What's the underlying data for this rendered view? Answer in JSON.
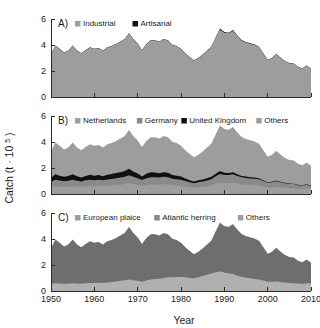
{
  "figure": {
    "xlabel": "Year",
    "ylabel_main": "Catch (t",
    "ylabel_mult": "· 10",
    "ylabel_exp": "5",
    "ylabel_close": ")",
    "ylabel_full": "Catch (t · 10⁵)"
  },
  "axes": {
    "x_ticks": [
      1950,
      1960,
      1970,
      1980,
      1990,
      2000,
      2010
    ],
    "x_tick_labels": [
      "1950",
      "1960",
      "1970",
      "1980",
      "1990",
      "2000",
      "2010"
    ],
    "y_ticks": [
      0,
      2,
      4,
      6
    ],
    "y_tick_labels": [
      "0",
      "2",
      "4",
      "6"
    ],
    "xlim": [
      1950,
      2010
    ],
    "ylim": [
      0,
      6
    ],
    "grid": false
  },
  "colors": {
    "light_grey": "#9d9d9d",
    "mid_grey": "#8a8a8a",
    "dark_grey": "#6e6e6e",
    "black": "#101010",
    "very_light_grey": "#b0b0b0",
    "axis": "#2b2b2b",
    "background": "#ffffff"
  },
  "panels": [
    {
      "tag": "A)",
      "legend": [
        {
          "label": "Industrial",
          "swatch": "#9d9d9d"
        },
        {
          "label": "Artisanal",
          "swatch": "#101010"
        }
      ]
    },
    {
      "tag": "B)",
      "legend": [
        {
          "label": "Netherlands",
          "swatch": "#9d9d9d"
        },
        {
          "label": "Germany",
          "swatch": "#8a8a8a"
        },
        {
          "label": "United Kingdom",
          "swatch": "#101010"
        },
        {
          "label": "Others",
          "swatch": "#9d9d9d"
        }
      ]
    },
    {
      "tag": "C)",
      "legend": [
        {
          "label": "European plaice",
          "swatch": "#9d9d9d"
        },
        {
          "label": "Atlantic herring",
          "swatch": "#8a8a8a"
        },
        {
          "label": "Others",
          "swatch": "#9d9d9d"
        }
      ]
    }
  ],
  "chart_data": [
    {
      "type": "area",
      "panel": "A)",
      "title": "A) Industrial and Artisanal catch",
      "xlabel": "",
      "ylabel": "Catch (t · 10⁵)",
      "xlim": [
        1950,
        2010
      ],
      "ylim": [
        0,
        6
      ],
      "stacked": true,
      "x": [
        1950,
        1951,
        1952,
        1953,
        1954,
        1955,
        1956,
        1957,
        1958,
        1959,
        1960,
        1961,
        1962,
        1963,
        1964,
        1965,
        1966,
        1967,
        1968,
        1969,
        1970,
        1971,
        1972,
        1973,
        1974,
        1975,
        1976,
        1977,
        1978,
        1979,
        1980,
        1981,
        1982,
        1983,
        1984,
        1985,
        1986,
        1987,
        1988,
        1989,
        1990,
        1991,
        1992,
        1993,
        1994,
        1995,
        1996,
        1997,
        1998,
        1999,
        2000,
        2001,
        2002,
        2003,
        2004,
        2005,
        2006,
        2007,
        2008,
        2009,
        2010
      ],
      "series": [
        {
          "name": "Industrial",
          "color": "#9d9d9d",
          "values": [
            3.25,
            3.95,
            3.7,
            3.4,
            3.55,
            3.95,
            3.55,
            3.35,
            3.6,
            3.8,
            3.7,
            3.75,
            3.55,
            3.8,
            3.9,
            4.05,
            4.25,
            4.45,
            4.9,
            4.45,
            4.1,
            3.6,
            4.05,
            4.35,
            4.35,
            4.25,
            4.45,
            4.35,
            4.0,
            3.9,
            3.7,
            3.35,
            3.05,
            2.8,
            3.0,
            3.25,
            3.55,
            3.85,
            4.55,
            5.2,
            4.95,
            4.9,
            5.1,
            4.7,
            4.35,
            4.2,
            4.1,
            4.0,
            3.85,
            3.35,
            2.85,
            3.0,
            3.3,
            3.0,
            2.75,
            2.6,
            2.55,
            2.3,
            2.2,
            2.4,
            2.15
          ],
          "values_note": "units t · 10^5"
        },
        {
          "name": "Artisanal",
          "color": "#101010",
          "values": [
            0.02,
            0.02,
            0.02,
            0.02,
            0.02,
            0.02,
            0.02,
            0.02,
            0.02,
            0.02,
            0.02,
            0.02,
            0.02,
            0.02,
            0.02,
            0.02,
            0.02,
            0.02,
            0.02,
            0.02,
            0.02,
            0.02,
            0.02,
            0.02,
            0.02,
            0.02,
            0.02,
            0.02,
            0.02,
            0.02,
            0.02,
            0.02,
            0.02,
            0.02,
            0.02,
            0.02,
            0.02,
            0.02,
            0.03,
            0.06,
            0.05,
            0.04,
            0.06,
            0.04,
            0.03,
            0.03,
            0.03,
            0.03,
            0.02,
            0.02,
            0.02,
            0.02,
            0.02,
            0.02,
            0.02,
            0.02,
            0.02,
            0.02,
            0.02,
            0.02,
            0.02
          ]
        }
      ]
    },
    {
      "type": "area",
      "panel": "B)",
      "title": "B) Catch by country",
      "xlabel": "",
      "ylabel": "Catch (t · 10⁵)",
      "xlim": [
        1950,
        2010
      ],
      "ylim": [
        0,
        6
      ],
      "stacked": true,
      "x": [
        1950,
        1951,
        1952,
        1953,
        1954,
        1955,
        1956,
        1957,
        1958,
        1959,
        1960,
        1961,
        1962,
        1963,
        1964,
        1965,
        1966,
        1967,
        1968,
        1969,
        1970,
        1971,
        1972,
        1973,
        1974,
        1975,
        1976,
        1977,
        1978,
        1979,
        1980,
        1981,
        1982,
        1983,
        1984,
        1985,
        1986,
        1987,
        1988,
        1989,
        1990,
        1991,
        1992,
        1993,
        1994,
        1995,
        1996,
        1997,
        1998,
        1999,
        2000,
        2001,
        2002,
        2003,
        2004,
        2005,
        2006,
        2007,
        2008,
        2009,
        2010
      ],
      "series": [
        {
          "name": "Netherlands",
          "color": "#9d9d9d",
          "values": [
            0.55,
            0.62,
            0.58,
            0.56,
            0.58,
            0.62,
            0.58,
            0.55,
            0.6,
            0.62,
            0.6,
            0.62,
            0.6,
            0.64,
            0.66,
            0.7,
            0.72,
            0.76,
            0.82,
            0.76,
            0.7,
            0.62,
            0.7,
            0.74,
            0.74,
            0.72,
            0.76,
            0.74,
            0.68,
            0.66,
            0.64,
            0.58,
            0.52,
            0.48,
            0.52,
            0.56,
            0.6,
            0.66,
            0.78,
            0.88,
            0.84,
            0.84,
            0.88,
            0.8,
            0.74,
            0.72,
            0.7,
            0.68,
            0.66,
            0.58,
            0.48,
            0.52,
            0.56,
            0.52,
            0.48,
            0.44,
            0.44,
            0.4,
            0.38,
            0.42,
            0.36
          ]
        },
        {
          "name": "Germany",
          "color": "#8a8a8a",
          "values": [
            0.4,
            0.48,
            0.45,
            0.42,
            0.44,
            0.48,
            0.44,
            0.42,
            0.45,
            0.48,
            0.46,
            0.48,
            0.45,
            0.48,
            0.5,
            0.52,
            0.54,
            0.56,
            0.62,
            0.56,
            0.52,
            0.45,
            0.52,
            0.55,
            0.55,
            0.54,
            0.56,
            0.55,
            0.5,
            0.48,
            0.46,
            0.42,
            0.38,
            0.35,
            0.38,
            0.4,
            0.44,
            0.48,
            0.58,
            0.66,
            0.62,
            0.62,
            0.64,
            0.58,
            0.54,
            0.52,
            0.5,
            0.5,
            0.48,
            0.42,
            0.36,
            0.38,
            0.42,
            0.38,
            0.34,
            0.32,
            0.32,
            0.28,
            0.27,
            0.3,
            0.26
          ]
        },
        {
          "name": "United Kingdom",
          "color": "#101010",
          "values": [
            0.3,
            0.42,
            0.38,
            0.34,
            0.36,
            0.42,
            0.34,
            0.3,
            0.34,
            0.38,
            0.34,
            0.36,
            0.32,
            0.36,
            0.38,
            0.4,
            0.42,
            0.44,
            0.5,
            0.42,
            0.36,
            0.28,
            0.34,
            0.38,
            0.36,
            0.34,
            0.36,
            0.34,
            0.28,
            0.26,
            0.24,
            0.2,
            0.16,
            0.14,
            0.15,
            0.16,
            0.17,
            0.18,
            0.2,
            0.22,
            0.18,
            0.16,
            0.16,
            0.13,
            0.11,
            0.1,
            0.09,
            0.08,
            0.07,
            0.06,
            0.05,
            0.05,
            0.05,
            0.04,
            0.04,
            0.04,
            0.03,
            0.03,
            0.03,
            0.03,
            0.03
          ]
        },
        {
          "name": "Others",
          "color": "#9d9d9d",
          "values": [
            2.02,
            2.45,
            2.31,
            2.1,
            2.19,
            2.45,
            2.21,
            2.1,
            2.23,
            2.34,
            2.32,
            2.31,
            2.2,
            2.34,
            2.38,
            2.45,
            2.59,
            2.71,
            2.98,
            2.73,
            2.54,
            2.27,
            2.51,
            2.7,
            2.72,
            2.67,
            2.79,
            2.74,
            2.56,
            2.52,
            2.38,
            2.17,
            2.01,
            1.85,
            1.97,
            2.15,
            2.36,
            2.55,
            3.02,
            3.5,
            3.36,
            3.32,
            3.48,
            3.23,
            2.99,
            2.89,
            2.84,
            2.77,
            2.66,
            2.31,
            1.98,
            2.07,
            2.29,
            2.08,
            1.91,
            1.82,
            1.78,
            1.61,
            1.54,
            1.67,
            1.52
          ]
        }
      ]
    },
    {
      "type": "area",
      "panel": "C)",
      "title": "C) Catch by species",
      "xlabel": "Year",
      "ylabel": "Catch (t · 10⁵)",
      "xlim": [
        1950,
        2010
      ],
      "ylim": [
        0,
        6
      ],
      "stacked": true,
      "x": [
        1950,
        1951,
        1952,
        1953,
        1954,
        1955,
        1956,
        1957,
        1958,
        1959,
        1960,
        1961,
        1962,
        1963,
        1964,
        1965,
        1966,
        1967,
        1968,
        1969,
        1970,
        1971,
        1972,
        1973,
        1974,
        1975,
        1976,
        1977,
        1978,
        1979,
        1980,
        1981,
        1982,
        1983,
        1984,
        1985,
        1986,
        1987,
        1988,
        1989,
        1990,
        1991,
        1992,
        1993,
        1994,
        1995,
        1996,
        1997,
        1998,
        1999,
        2000,
        2001,
        2002,
        2003,
        2004,
        2005,
        2006,
        2007,
        2008,
        2009,
        2010
      ],
      "series": [
        {
          "name": "European plaice",
          "color": "#b0b0b0",
          "values": [
            0.55,
            0.6,
            0.58,
            0.55,
            0.56,
            0.6,
            0.58,
            0.56,
            0.6,
            0.62,
            0.62,
            0.64,
            0.62,
            0.66,
            0.7,
            0.74,
            0.78,
            0.82,
            0.88,
            0.82,
            0.78,
            0.72,
            0.8,
            0.88,
            0.92,
            0.95,
            1.0,
            1.05,
            1.05,
            1.08,
            1.1,
            1.05,
            1.0,
            0.98,
            1.05,
            1.15,
            1.25,
            1.35,
            1.45,
            1.5,
            1.42,
            1.35,
            1.3,
            1.18,
            1.1,
            1.02,
            0.98,
            0.92,
            0.88,
            0.8,
            0.72,
            0.72,
            0.74,
            0.7,
            0.66,
            0.62,
            0.6,
            0.58,
            0.56,
            0.6,
            0.58
          ]
        },
        {
          "name": "Atlantic herring",
          "color": "#6e6e6e",
          "values": [
            2.7,
            3.35,
            3.12,
            2.85,
            2.99,
            3.35,
            2.97,
            2.79,
            3.0,
            3.18,
            3.08,
            3.11,
            2.93,
            3.14,
            3.2,
            3.31,
            3.47,
            3.63,
            4.02,
            3.63,
            3.32,
            2.88,
            3.25,
            3.47,
            3.43,
            3.3,
            3.45,
            3.3,
            2.95,
            2.82,
            2.6,
            2.3,
            2.05,
            1.82,
            1.95,
            2.1,
            2.3,
            2.5,
            3.1,
            3.7,
            3.53,
            3.55,
            3.8,
            3.52,
            3.25,
            3.18,
            3.12,
            3.08,
            2.97,
            2.55,
            2.13,
            2.28,
            2.56,
            2.3,
            2.09,
            1.98,
            1.95,
            1.72,
            1.64,
            1.8,
            1.57
          ]
        },
        {
          "name": "Others",
          "color": "#8a8a8a",
          "values": [
            0.02,
            0.02,
            0.02,
            0.02,
            0.02,
            0.02,
            0.02,
            0.02,
            0.02,
            0.02,
            0.02,
            0.02,
            0.02,
            0.02,
            0.02,
            0.02,
            0.02,
            0.02,
            0.02,
            0.02,
            0.02,
            0.02,
            0.02,
            0.02,
            0.02,
            0.02,
            0.02,
            0.02,
            0.02,
            0.02,
            0.02,
            0.02,
            0.02,
            0.02,
            0.02,
            0.02,
            0.02,
            0.02,
            0.03,
            0.06,
            0.05,
            0.04,
            0.06,
            0.04,
            0.03,
            0.03,
            0.03,
            0.03,
            0.02,
            0.02,
            0.02,
            0.02,
            0.02,
            0.02,
            0.02,
            0.02,
            0.02,
            0.02,
            0.02,
            0.02,
            0.02
          ]
        }
      ]
    }
  ]
}
